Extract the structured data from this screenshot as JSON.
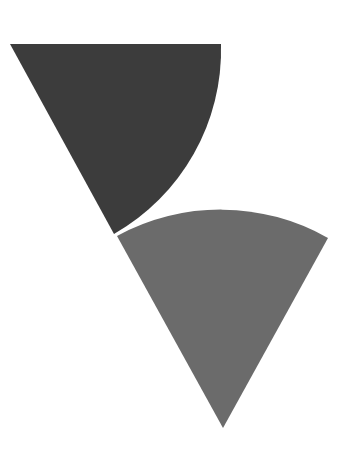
{
  "diagram": {
    "background": "#ffffff",
    "shapes": [
      {
        "id": "dark-sector",
        "type": "circular-sector",
        "center": [
          10,
          44
        ],
        "radius": 212,
        "start_point": [
          221,
          44
        ],
        "end_point": [
          114,
          234
        ],
        "fill": "#3c3c3c"
      },
      {
        "id": "light-sector",
        "type": "circular-sector",
        "center": [
          223,
          428
        ],
        "radius": 217,
        "start_point": [
          117,
          236
        ],
        "end_point": [
          328,
          238
        ],
        "fill": "#6b6b6b"
      }
    ]
  }
}
